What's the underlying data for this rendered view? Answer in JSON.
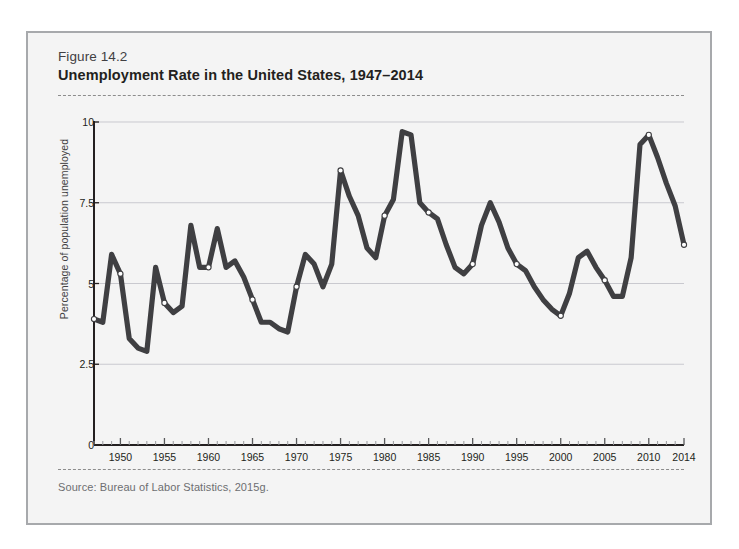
{
  "figure": {
    "number": "Figure 14.2",
    "title": "Unemployment Rate in the United States, 1947–2014",
    "source": "Source: Bureau of Labor Statistics, 2015g."
  },
  "colors": {
    "line": "#3f3f42",
    "grid": "#c9c9cf",
    "axis": "#231f20",
    "panel": "#f4f4f4",
    "border": "#a7a9ac",
    "marker_fill": "#ffffff"
  },
  "ghost_text": {
    "heading": "ERS AND \"WORK\" TO RUL",
    "lines": [
      "s of the and emand work. to the the ra",
      "and ve ent to of and work of labor m",
      "ment of ho with a small of the and w",
      "ion the and part of the and the of wo",
      "of the labor a of that in the be of the",
      "and the of work the on and the was in",
      "ment of the work to the the the labor",
      "in the and of the market and the wor",
      "and the of work in the and of the to p",
      "ve of the market and in the of a work",
      "of labor and that the in and the work"
    ]
  },
  "chart_data": {
    "type": "line",
    "title": "Unemployment Rate in the United States, 1947–2014",
    "xlabel": "",
    "ylabel": "Percentage of population unemployed",
    "xlim": [
      1947,
      2014
    ],
    "ylim": [
      0,
      10
    ],
    "yticks": [
      0,
      2.5,
      5,
      7.5,
      10
    ],
    "ytick_labels": [
      "0",
      "2.5",
      "5",
      "7.5",
      "10"
    ],
    "xticks": [
      1950,
      1955,
      1960,
      1965,
      1970,
      1975,
      1980,
      1985,
      1990,
      1995,
      2000,
      2005,
      2010,
      2014
    ],
    "xtick_labels": [
      "1950",
      "1955",
      "1960",
      "1965",
      "1970",
      "1975",
      "1980",
      "1985",
      "1990",
      "1995",
      "2000",
      "2005",
      "2010",
      "2014"
    ],
    "grid": true,
    "legend": false,
    "marker_years": [
      1947,
      1950,
      1955,
      1960,
      1965,
      1970,
      1975,
      1980,
      1985,
      1990,
      1995,
      2000,
      2005,
      2010,
      2014
    ],
    "series": [
      {
        "name": "Percentage of population unemployed",
        "x": [
          1947,
          1948,
          1949,
          1950,
          1951,
          1952,
          1953,
          1954,
          1955,
          1956,
          1957,
          1958,
          1959,
          1960,
          1961,
          1962,
          1963,
          1964,
          1965,
          1966,
          1967,
          1968,
          1969,
          1970,
          1971,
          1972,
          1973,
          1974,
          1975,
          1976,
          1977,
          1978,
          1979,
          1980,
          1981,
          1982,
          1983,
          1984,
          1985,
          1986,
          1987,
          1988,
          1989,
          1990,
          1991,
          1992,
          1993,
          1994,
          1995,
          1996,
          1997,
          1998,
          1999,
          2000,
          2001,
          2002,
          2003,
          2004,
          2005,
          2006,
          2007,
          2008,
          2009,
          2010,
          2011,
          2012,
          2013,
          2014
        ],
        "y": [
          3.9,
          3.8,
          5.9,
          5.3,
          3.3,
          3.0,
          2.9,
          5.5,
          4.4,
          4.1,
          4.3,
          6.8,
          5.5,
          5.5,
          6.7,
          5.5,
          5.7,
          5.2,
          4.5,
          3.8,
          3.8,
          3.6,
          3.5,
          4.9,
          5.9,
          5.6,
          4.9,
          5.6,
          8.5,
          7.7,
          7.1,
          6.1,
          5.8,
          7.1,
          7.6,
          9.7,
          9.6,
          7.5,
          7.2,
          7.0,
          6.2,
          5.5,
          5.3,
          5.6,
          6.8,
          7.5,
          6.9,
          6.1,
          5.6,
          5.4,
          4.9,
          4.5,
          4.2,
          4.0,
          4.7,
          5.8,
          6.0,
          5.5,
          5.1,
          4.6,
          4.6,
          5.8,
          9.3,
          9.6,
          8.9,
          8.1,
          7.4,
          6.2
        ]
      }
    ]
  }
}
